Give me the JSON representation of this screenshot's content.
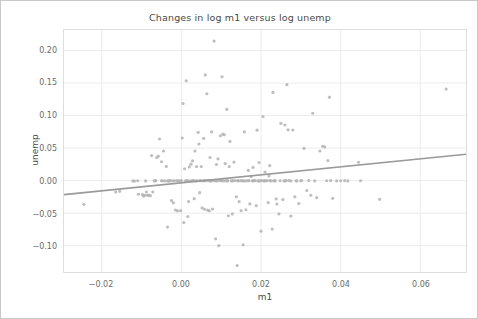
{
  "figure": {
    "title": "Changes in log m1 versus log unemp",
    "background_color": "#ffffff",
    "frame_color": "#c9c9c9"
  },
  "chart_data": {
    "type": "scatter",
    "title": "Changes in log m1 versus log unemp",
    "xlabel": "m1",
    "ylabel": "unemp",
    "grid": true,
    "legend": null,
    "point_color": "#b3b3b3",
    "point_size": 3.2,
    "point_opacity": 0.85,
    "xlim": [
      -0.0295,
      0.0715
    ],
    "ylim": [
      -0.1405,
      0.2315
    ],
    "xticks": [
      -0.02,
      0.0,
      0.02,
      0.04,
      0.06
    ],
    "xticklabels": [
      "−0.02",
      "0.00",
      "0.02",
      "0.04",
      "0.06"
    ],
    "yticks": [
      -0.1,
      -0.05,
      0.0,
      0.05,
      0.1,
      0.15,
      0.2
    ],
    "yticklabels": [
      "−0.10",
      "−0.05",
      "0.00",
      "0.05",
      "0.10",
      "0.15",
      "0.20"
    ],
    "trendline": {
      "type": "linear",
      "color": "#9a9a9a",
      "width": 1.6,
      "x_start": -0.0295,
      "y_start": -0.0215,
      "x_end": 0.0715,
      "y_end": 0.0405
    },
    "x": [
      -0.0245,
      -0.0165,
      -0.0155,
      -0.0122,
      -0.0118,
      -0.0108,
      -0.0098,
      -0.0095,
      -0.0092,
      -0.0088,
      -0.0085,
      -0.0082,
      -0.0078,
      -0.0075,
      -0.0072,
      -0.0068,
      -0.0065,
      -0.0062,
      -0.0058,
      -0.0055,
      -0.005,
      -0.0048,
      -0.0045,
      -0.0042,
      -0.0038,
      -0.0035,
      -0.0032,
      -0.003,
      -0.0028,
      -0.0025,
      -0.0022,
      -0.002,
      -0.0018,
      -0.0015,
      -0.0012,
      -0.001,
      -0.0008,
      -0.0005,
      -0.0002,
      0.0,
      0.0002,
      0.0004,
      0.0006,
      0.0008,
      0.001,
      0.0012,
      0.0014,
      0.0016,
      0.0018,
      0.002,
      0.0022,
      0.0024,
      0.0026,
      0.0028,
      0.003,
      0.0032,
      0.0034,
      0.0036,
      0.0038,
      0.004,
      0.0042,
      0.0044,
      0.0046,
      0.0048,
      0.005,
      0.0052,
      0.0054,
      0.0056,
      0.0058,
      0.006,
      0.0062,
      0.0064,
      0.0066,
      0.0068,
      0.007,
      0.0072,
      0.0074,
      0.0076,
      0.0078,
      0.008,
      0.0082,
      0.0084,
      0.0086,
      0.0088,
      0.009,
      0.0092,
      0.0094,
      0.0096,
      0.0098,
      0.01,
      0.0102,
      0.0104,
      0.0106,
      0.0108,
      0.011,
      0.0112,
      0.0114,
      0.0116,
      0.0118,
      0.012,
      0.0122,
      0.0125,
      0.0128,
      0.013,
      0.0132,
      0.0135,
      0.0138,
      0.014,
      0.0142,
      0.0145,
      0.0148,
      0.015,
      0.0152,
      0.0155,
      0.0158,
      0.016,
      0.0162,
      0.0165,
      0.0168,
      0.017,
      0.0172,
      0.0175,
      0.0178,
      0.018,
      0.0182,
      0.0185,
      0.0188,
      0.019,
      0.0192,
      0.0195,
      0.0198,
      0.02,
      0.0202,
      0.0205,
      0.0208,
      0.021,
      0.0212,
      0.0215,
      0.0218,
      0.022,
      0.0222,
      0.0225,
      0.0228,
      0.023,
      0.0232,
      0.0235,
      0.0238,
      0.024,
      0.0245,
      0.025,
      0.0255,
      0.0258,
      0.026,
      0.0262,
      0.0265,
      0.0268,
      0.027,
      0.0275,
      0.028,
      0.0285,
      0.029,
      0.0295,
      0.03,
      0.0308,
      0.0315,
      0.032,
      0.0325,
      0.033,
      0.0335,
      0.034,
      0.0348,
      0.0355,
      0.036,
      0.0365,
      0.0368,
      0.0372,
      0.0375,
      0.038,
      0.039,
      0.04,
      0.041,
      0.0418,
      0.0445,
      0.045,
      0.0498,
      0.0665,
      0.0046,
      0.0058,
      0.0072,
      0.0086,
      0.01,
      0.0115,
      0.0128,
      0.0142,
      0.0155,
      0.0168,
      0.0182,
      0.0195,
      0.0208,
      0.0222,
      0.0235,
      0.0248,
      0.0262,
      0.0275,
      0.0288,
      0.0302,
      0.0016,
      0.003,
      -0.0035,
      -0.005,
      -0.0065,
      -0.009,
      -0.011
    ],
    "y": [
      -0.0365,
      -0.0175,
      -0.0165,
      -0.0005,
      -0.0008,
      -0.021,
      -0.0215,
      -0.024,
      -0.0225,
      -0.0175,
      -0.0228,
      -0.0222,
      -0.0232,
      0.0385,
      -0.0175,
      -0.0005,
      -0.0002,
      0.0355,
      0.0375,
      0.064,
      0.029,
      -0.0002,
      0.0455,
      -0.0005,
      0.0218,
      -0.0715,
      -0.0002,
      -0.0005,
      0.0,
      -0.0308,
      -0.0005,
      -0.0342,
      -0.0002,
      -0.0452,
      0.0,
      -0.0465,
      -0.0005,
      -0.0002,
      -0.0462,
      0.0,
      0.0655,
      0.1185,
      -0.0645,
      0.0182,
      -0.0002,
      0.1535,
      0.0,
      -0.0552,
      -0.0322,
      0.021,
      -0.0005,
      0.0252,
      -0.0002,
      0.0302,
      0.0,
      -0.0278,
      0.0455,
      -0.0005,
      0.0215,
      -0.0002,
      0.0742,
      0.0562,
      -0.0185,
      0.0,
      0.0215,
      -0.042,
      -0.0005,
      0.0648,
      -0.044,
      0.1625,
      -0.0002,
      0.1335,
      -0.0455,
      0.0,
      -0.0465,
      0.0355,
      -0.0005,
      0.0748,
      -0.0438,
      -0.0002,
      0.2145,
      0.0,
      -0.0895,
      0.0248,
      -0.0005,
      0.0335,
      -0.1,
      -0.0002,
      0.069,
      0.0,
      0.1595,
      0.0715,
      -0.0005,
      0.0705,
      0.0262,
      -0.0002,
      0.1095,
      0.0,
      -0.054,
      0.0215,
      0.0602,
      -0.0005,
      -0.0512,
      -0.0002,
      0.0285,
      0.0,
      -0.0248,
      -0.1305,
      -0.0005,
      -0.0322,
      -0.0002,
      -0.0462,
      0.0,
      -0.0988,
      0.0748,
      -0.0005,
      -0.0448,
      -0.0002,
      0.0158,
      0.0,
      -0.0358,
      0.0062,
      -0.0005,
      0.0202,
      -0.0002,
      0.0,
      -0.0385,
      0.0775,
      -0.0005,
      0.0278,
      -0.0002,
      -0.0778,
      0.0,
      0.0985,
      -0.0005,
      0.0132,
      -0.0002,
      0.0,
      -0.0338,
      0.0072,
      0.023,
      -0.0005,
      -0.0745,
      0.1355,
      -0.0002,
      0.0,
      -0.0282,
      -0.036,
      -0.0512,
      0.088,
      -0.0292,
      -0.0005,
      0.0855,
      -0.0002,
      0.1475,
      0.078,
      0.0,
      -0.0545,
      0.0778,
      -0.025,
      -0.0005,
      -0.0352,
      -0.0002,
      0.0495,
      -0.0152,
      0.0,
      -0.0225,
      0.1035,
      -0.0005,
      -0.0262,
      0.0455,
      0.0528,
      0.0518,
      -0.0002,
      0.0308,
      0.1282,
      0.0,
      -0.0272,
      -0.0005,
      -0.0002,
      0.0,
      -0.0005,
      0.0282,
      -0.0002,
      -0.0288,
      0.1408,
      -0.0002,
      0.0,
      -0.0005,
      -0.0002,
      0.0,
      -0.0005,
      -0.0002,
      0.0,
      -0.0005,
      -0.0002,
      0.0,
      -0.0005,
      -0.0002,
      0.0,
      -0.0005,
      -0.0002,
      0.0,
      -0.0005,
      -0.0002,
      0.0,
      -0.0002,
      0.0,
      -0.0005,
      -0.0002,
      0.0,
      -0.0005,
      -0.0002
    ]
  }
}
